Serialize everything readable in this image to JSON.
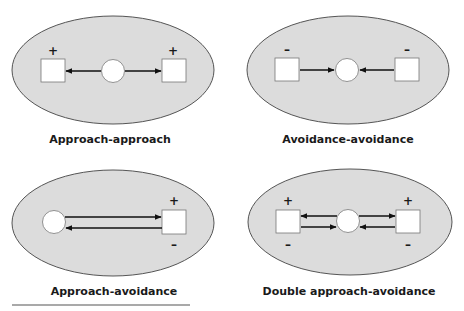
{
  "colors": {
    "ellipse_fill": "#dcdcdc",
    "ellipse_stroke": "#555555",
    "node_fill": "#ffffff",
    "node_stroke": "#777777",
    "arrow": "#111111",
    "rule": "#555555"
  },
  "panels": [
    {
      "id": "approach-approach",
      "caption": "Approach-approach",
      "left_sign_top": "+",
      "right_sign_top": "+",
      "arrows": [
        "center-to-left",
        "center-to-right"
      ]
    },
    {
      "id": "avoidance-avoidance",
      "caption": "Avoidance-avoidance",
      "left_sign_top": "–",
      "right_sign_top": "–",
      "arrows": [
        "left-to-center",
        "right-to-center"
      ]
    },
    {
      "id": "approach-avoidance",
      "caption": "Approach-avoidance",
      "right_sign_top": "+",
      "right_sign_bottom": "–",
      "arrows": [
        "center-to-right",
        "right-to-center"
      ]
    },
    {
      "id": "double-approach-avoidance",
      "caption": "Double approach-avoidance",
      "left_sign_top": "+",
      "left_sign_bottom": "–",
      "right_sign_top": "+",
      "right_sign_bottom": "–",
      "arrows": [
        "center-to-left",
        "left-to-center",
        "center-to-right",
        "right-to-center"
      ]
    }
  ]
}
